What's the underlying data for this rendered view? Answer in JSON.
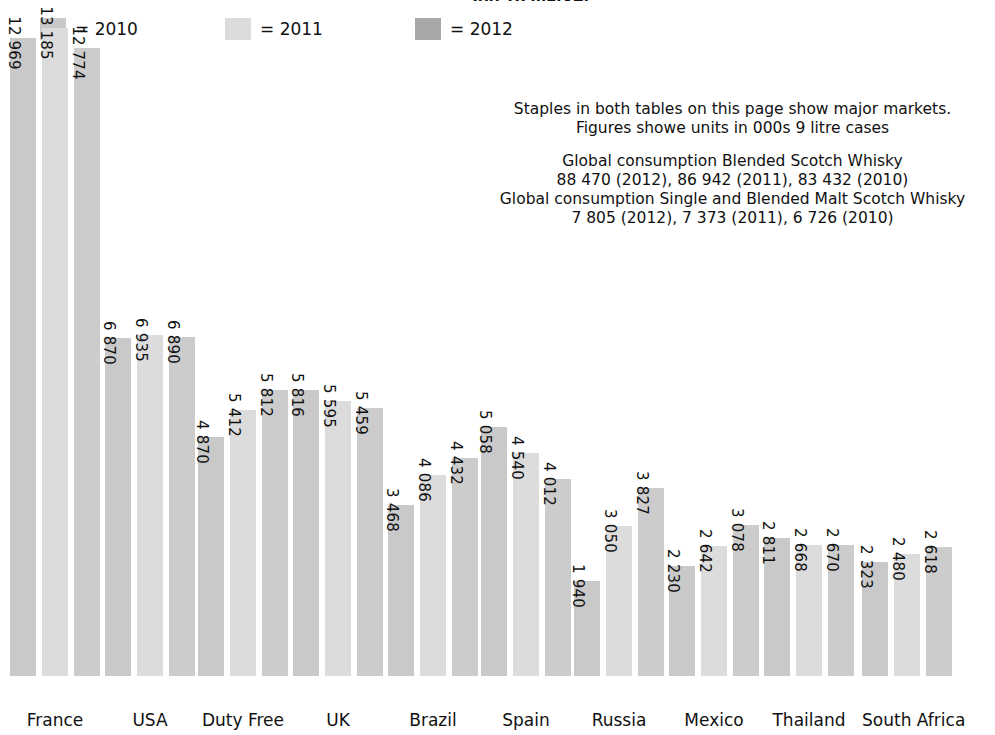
{
  "title": "Top 10 markets",
  "legend": {
    "position": "top-left",
    "items": [
      {
        "label": "= 2010",
        "year": "2010",
        "color": "#c9c9c9"
      },
      {
        "label": "= 2011",
        "year": "2011",
        "color": "#dcdcdc"
      },
      {
        "label": "= 2012",
        "year": "2012",
        "color": "#a8a8a8"
      }
    ]
  },
  "annotation": {
    "block1": [
      "Staples in both tables on this page show major markets.",
      "Figures showe units in 000s 9 litre cases"
    ],
    "block2": [
      "Global consumption Blended Scotch Whisky",
      "88 470 (2012), 86 942 (2011), 83 432 (2010)",
      "Global consumption Single and Blended Malt Scotch Whisky",
      "7 805 (2012), 7 373 (2011), 6 726 (2010)"
    ]
  },
  "chart_data": {
    "type": "bar",
    "title": "Top 10 markets",
    "xlabel": "",
    "ylabel": "",
    "unit": "000s 9 litre cases",
    "grid": false,
    "legend_position": "top-left",
    "ylim": [
      0,
      13185
    ],
    "categories": [
      "France",
      "USA",
      "Duty Free",
      "UK",
      "Brazil",
      "Spain",
      "Russia",
      "Mexico",
      "Thailand",
      "South Africa"
    ],
    "series": [
      {
        "name": "2010",
        "color": "#c9c9c9",
        "values": [
          12969,
          6870,
          4870,
          5816,
          3468,
          5058,
          1940,
          2230,
          2811,
          2323
        ],
        "labels": [
          "12 969",
          "6 870",
          "4 870",
          "5 816",
          "3 468",
          "5 058",
          "1 940",
          "2 230",
          "2 811",
          "2 323"
        ]
      },
      {
        "name": "2011",
        "color": "#dcdcdc",
        "values": [
          13185,
          6935,
          5412,
          5595,
          4086,
          4540,
          3050,
          2642,
          2668,
          2480
        ],
        "labels": [
          "13 185",
          "6 935",
          "5 412",
          "5 595",
          "4 086",
          "4 540",
          "3 050",
          "2 642",
          "2 668",
          "2 480"
        ]
      },
      {
        "name": "2012",
        "color": "#cccccc",
        "values": [
          12774,
          6890,
          5812,
          5459,
          4432,
          4012,
          3827,
          3078,
          2670,
          2618
        ],
        "labels": [
          "12 774",
          "6 890",
          "5 812",
          "5 459",
          "4 432",
          "4 012",
          "3 827",
          "3 078",
          "2 670",
          "2 618"
        ]
      }
    ],
    "totals": {
      "blended_scotch_whisky": {
        "2012": 88470,
        "2011": 86942,
        "2010": 83432
      },
      "single_and_blended_malt_scotch_whisky": {
        "2012": 7805,
        "2011": 7373,
        "2010": 6726
      }
    }
  },
  "layout": {
    "group_left": [
      10,
      105,
      198,
      293,
      388,
      481,
      574,
      669,
      764,
      862
    ],
    "group_width": 90,
    "bar_width": 26,
    "bar_gap": 6,
    "baseline_y": 705,
    "top_y": 57,
    "px_per_unit": 0.04917
  }
}
